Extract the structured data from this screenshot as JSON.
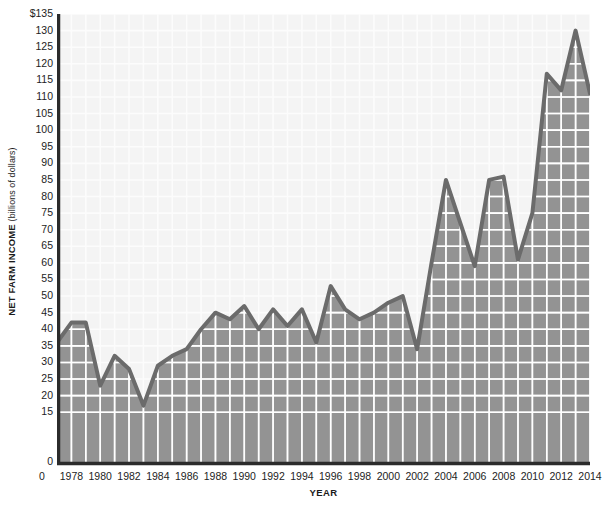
{
  "chart_data": {
    "type": "area",
    "title": "",
    "xlabel": "YEAR",
    "ylabel": "NET FARM INCOME",
    "ylabel_units": "(billions of dollars)",
    "xlim": [
      1977,
      2014
    ],
    "ylim": [
      0,
      135
    ],
    "grid": true,
    "legend": "none",
    "y_ticks": [
      "$135",
      "130",
      "125",
      "120",
      "115",
      "110",
      "105",
      "100",
      "95",
      "90",
      "85",
      "80",
      "75",
      "70",
      "65",
      "60",
      "55",
      "50",
      "45",
      "40",
      "35",
      "30",
      "25",
      "20",
      "15",
      "0"
    ],
    "y_tick_values": [
      135,
      130,
      125,
      120,
      115,
      110,
      105,
      100,
      95,
      90,
      85,
      80,
      75,
      70,
      65,
      60,
      55,
      50,
      45,
      40,
      35,
      30,
      25,
      20,
      15,
      0
    ],
    "x_ticks": [
      "1978",
      "1980",
      "1982",
      "1984",
      "1986",
      "1988",
      "1990",
      "1992",
      "1994",
      "1996",
      "1998",
      "2000",
      "2002",
      "2004",
      "2006",
      "2008",
      "2010",
      "2012",
      "2014"
    ],
    "x_origin_label": "0",
    "x": [
      1977,
      1978,
      1979,
      1980,
      1981,
      1982,
      1983,
      1984,
      1985,
      1986,
      1987,
      1988,
      1989,
      1990,
      1991,
      1992,
      1993,
      1994,
      1995,
      1996,
      1997,
      1998,
      1999,
      2000,
      2001,
      2002,
      2003,
      2004,
      2005,
      2006,
      2007,
      2008,
      2009,
      2010,
      2011,
      2012,
      2013,
      2014
    ],
    "values": [
      36,
      42,
      42,
      23,
      32,
      28,
      17,
      29,
      32,
      34,
      40,
      45,
      43,
      47,
      40,
      46,
      41,
      46,
      36,
      53,
      46,
      43,
      45,
      48,
      50,
      34,
      60,
      85,
      72,
      59,
      85,
      86,
      61,
      75,
      117,
      112,
      130,
      111
    ],
    "series_name": "Net farm income",
    "colors": {
      "line": "#6b6b6b",
      "fill": "#939393",
      "grid": "#ffffff",
      "plot_background": "#f4f4f4",
      "axis": "#2b2b2b",
      "text": "#1d1d1d"
    }
  }
}
